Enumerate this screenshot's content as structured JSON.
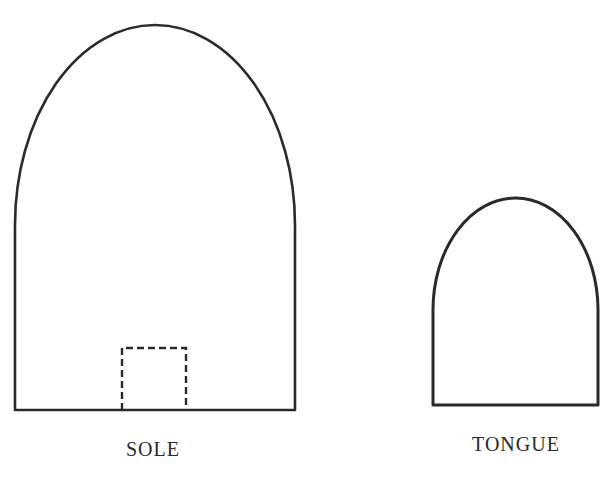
{
  "diagram": {
    "title": "",
    "colors": {
      "stroke": "#2a2a2a",
      "background": "#ffffff"
    },
    "shapes": [
      {
        "id": "sole",
        "label": "SOLE",
        "kind": "arched-rectangle",
        "left": 15,
        "right": 295,
        "bottom": 410,
        "shoulder": 225,
        "apex": 25,
        "notch": {
          "kind": "dashed-rectangle",
          "left": 122,
          "right": 186,
          "top": 348,
          "bottom": 410
        }
      },
      {
        "id": "tongue",
        "label": "TONGUE",
        "kind": "arched-rectangle",
        "left": 433,
        "right": 598,
        "bottom": 405,
        "shoulder": 310,
        "apex": 198
      }
    ]
  }
}
